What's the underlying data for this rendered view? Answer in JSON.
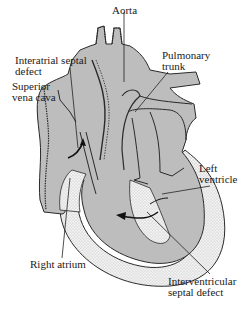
{
  "diagram": {
    "type": "anatomical illustration",
    "colors": {
      "chamber_fill": "#bdbdbd",
      "wall_outline": "#2a2a2a",
      "myocardium_stipple": "#e6e6e6",
      "background": "#ffffff",
      "text": "#1a1a1a"
    },
    "labels": {
      "aorta": "Aorta",
      "pulmonary_trunk_1": "Pulmonary",
      "pulmonary_trunk_2": "trunk",
      "interatrial_1": "Interatrial septal",
      "interatrial_2": "defect",
      "svc_1": "Superior",
      "svc_2": "vena cava",
      "left_ventricle_1": "Left",
      "left_ventricle_2": "ventricle",
      "right_atrium": "Right atrium",
      "ivsd_1": "Interventricular",
      "ivsd_2": "septal defect"
    }
  }
}
